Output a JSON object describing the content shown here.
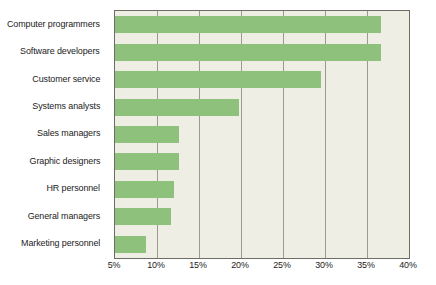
{
  "chart_data": {
    "type": "bar",
    "orientation": "horizontal",
    "title": "",
    "subtitle": "",
    "xlabel": "",
    "ylabel": "",
    "categories": [
      "Computer programmers",
      "Software developers",
      "Customer service",
      "Systems analysts",
      "Sales managers",
      "Graphic designers",
      "HR personnel",
      "General managers",
      "Marketing personnel"
    ],
    "values": [
      36.7,
      36.7,
      29.5,
      19.8,
      12.6,
      12.6,
      12.0,
      11.7,
      8.7
    ],
    "value_unit": "%",
    "xlim": [
      5,
      40
    ],
    "xticks": [
      5,
      10,
      15,
      20,
      25,
      30,
      35,
      40
    ],
    "xtick_labels": [
      "5%",
      "10%",
      "15%",
      "20%",
      "25%",
      "30%",
      "35%",
      "40%"
    ],
    "grid": "vertical",
    "legend": "none",
    "bar_color": "#8dc17c",
    "plot_background": "#eeeee5",
    "axis_color": "#6d6d66",
    "gridline_color": "#9a9a90",
    "text_color": "#1b1b1b"
  }
}
